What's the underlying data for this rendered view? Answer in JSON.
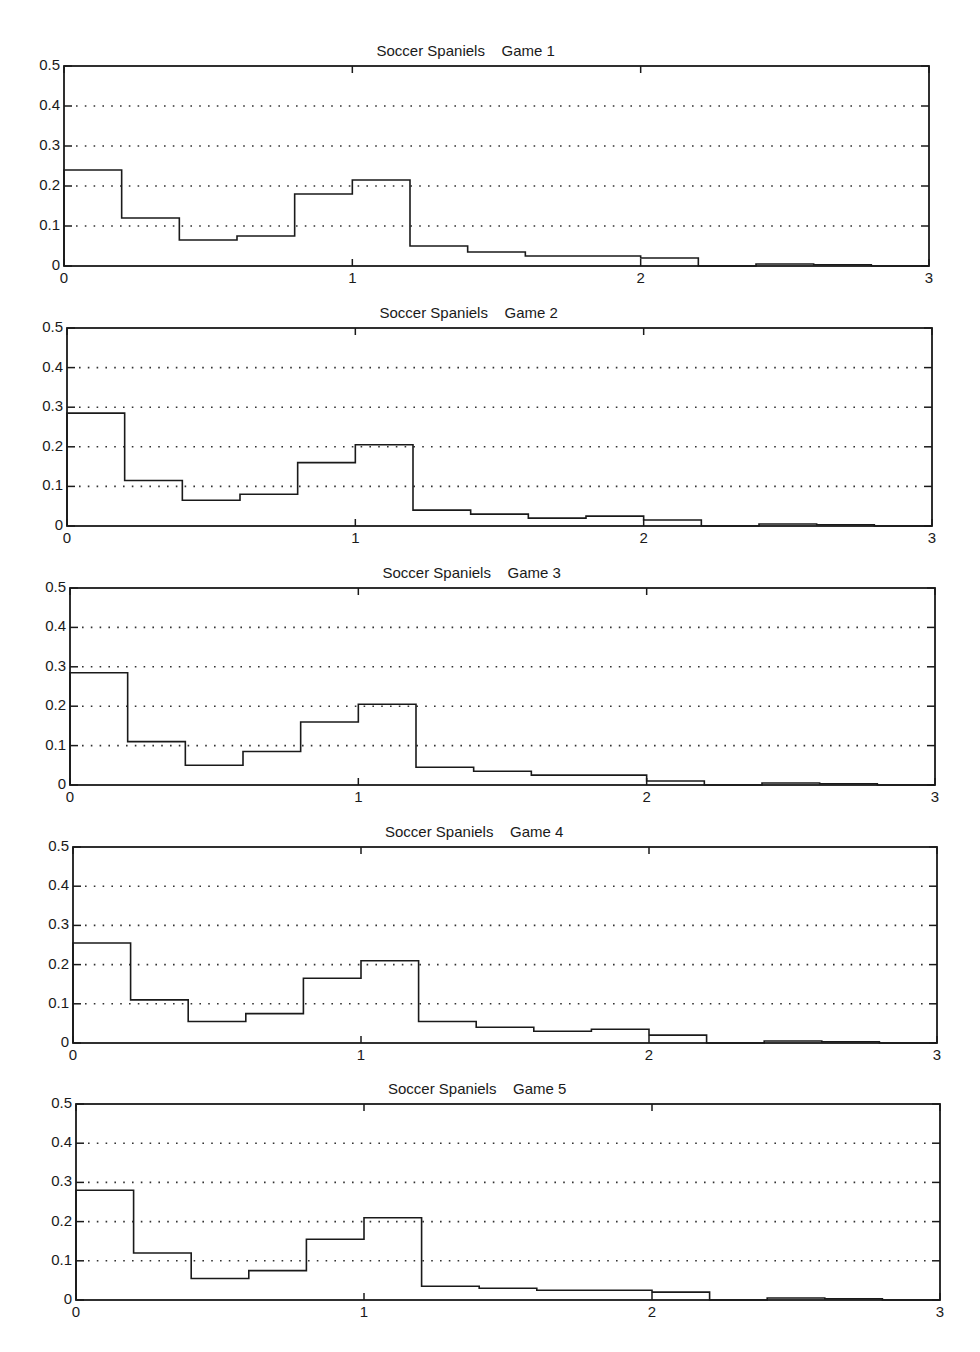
{
  "chart_data": [
    {
      "type": "histogram",
      "title": "Soccer Spaniels    Game 1",
      "xlabel": "",
      "ylabel": "",
      "xlim": [
        0,
        3
      ],
      "ylim": [
        0,
        0.5
      ],
      "x_ticks": [
        "0",
        "1",
        "2",
        "3"
      ],
      "y_ticks": [
        "0",
        "0.1",
        "0.2",
        "0.3",
        "0.4",
        "0.5"
      ],
      "grid": "horizontal-dotted",
      "bin_width": 0.2,
      "bin_edges": [
        0,
        0.2,
        0.4,
        0.6,
        0.8,
        1.0,
        1.2,
        1.4,
        1.6,
        1.8,
        2.0,
        2.2,
        2.4,
        2.6,
        2.8
      ],
      "values": [
        0.24,
        0.12,
        0.065,
        0.075,
        0.18,
        0.215,
        0.05,
        0.035,
        0.025,
        0.025,
        0.02,
        0.0,
        0.005,
        0.003,
        0.0
      ]
    },
    {
      "type": "histogram",
      "title": "Soccer Spaniels    Game 2",
      "xlabel": "",
      "ylabel": "",
      "xlim": [
        0,
        3
      ],
      "ylim": [
        0,
        0.5
      ],
      "x_ticks": [
        "0",
        "1",
        "2",
        "3"
      ],
      "y_ticks": [
        "0",
        "0.1",
        "0.2",
        "0.3",
        "0.4",
        "0.5"
      ],
      "grid": "horizontal-dotted",
      "bin_width": 0.2,
      "bin_edges": [
        0,
        0.2,
        0.4,
        0.6,
        0.8,
        1.0,
        1.2,
        1.4,
        1.6,
        1.8,
        2.0,
        2.2,
        2.4,
        2.6,
        2.8
      ],
      "values": [
        0.285,
        0.115,
        0.065,
        0.08,
        0.16,
        0.205,
        0.04,
        0.03,
        0.02,
        0.025,
        0.015,
        0.0,
        0.005,
        0.003,
        0.0
      ]
    },
    {
      "type": "histogram",
      "title": "Soccer Spaniels    Game 3",
      "xlabel": "",
      "ylabel": "",
      "xlim": [
        0,
        3
      ],
      "ylim": [
        0,
        0.5
      ],
      "x_ticks": [
        "0",
        "1",
        "2",
        "3"
      ],
      "y_ticks": [
        "0",
        "0.1",
        "0.2",
        "0.3",
        "0.4",
        "0.5"
      ],
      "grid": "horizontal-dotted",
      "bin_width": 0.2,
      "bin_edges": [
        0,
        0.2,
        0.4,
        0.6,
        0.8,
        1.0,
        1.2,
        1.4,
        1.6,
        1.8,
        2.0,
        2.2,
        2.4,
        2.6,
        2.8
      ],
      "values": [
        0.285,
        0.11,
        0.05,
        0.085,
        0.16,
        0.205,
        0.045,
        0.035,
        0.025,
        0.025,
        0.01,
        0.0,
        0.005,
        0.003,
        0.0
      ]
    },
    {
      "type": "histogram",
      "title": "Soccer Spaniels    Game 4",
      "xlabel": "",
      "ylabel": "",
      "xlim": [
        0,
        3
      ],
      "ylim": [
        0,
        0.5
      ],
      "x_ticks": [
        "0",
        "1",
        "2",
        "3"
      ],
      "y_ticks": [
        "0",
        "0.1",
        "0.2",
        "0.3",
        "0.4",
        "0.5"
      ],
      "grid": "horizontal-dotted",
      "bin_width": 0.2,
      "bin_edges": [
        0,
        0.2,
        0.4,
        0.6,
        0.8,
        1.0,
        1.2,
        1.4,
        1.6,
        1.8,
        2.0,
        2.2,
        2.4,
        2.6,
        2.8
      ],
      "values": [
        0.255,
        0.11,
        0.055,
        0.075,
        0.165,
        0.21,
        0.055,
        0.04,
        0.03,
        0.035,
        0.02,
        0.0,
        0.005,
        0.003,
        0.0
      ]
    },
    {
      "type": "histogram",
      "title": "Soccer Spaniels    Game 5",
      "xlabel": "",
      "ylabel": "",
      "xlim": [
        0,
        3
      ],
      "ylim": [
        0,
        0.5
      ],
      "x_ticks": [
        "0",
        "1",
        "2",
        "3"
      ],
      "y_ticks": [
        "0",
        "0.1",
        "0.2",
        "0.3",
        "0.4",
        "0.5"
      ],
      "grid": "horizontal-dotted",
      "bin_width": 0.2,
      "bin_edges": [
        0,
        0.2,
        0.4,
        0.6,
        0.8,
        1.0,
        1.2,
        1.4,
        1.6,
        1.8,
        2.0,
        2.2,
        2.4,
        2.6,
        2.8
      ],
      "values": [
        0.28,
        0.12,
        0.055,
        0.075,
        0.155,
        0.21,
        0.035,
        0.03,
        0.025,
        0.025,
        0.02,
        0.0,
        0.005,
        0.003,
        0.0
      ]
    }
  ],
  "layout": {
    "panels": [
      {
        "left": 64,
        "top": 66,
        "right": 929,
        "bottom": 266
      },
      {
        "left": 67,
        "top": 328,
        "right": 932,
        "bottom": 526
      },
      {
        "left": 70,
        "top": 588,
        "right": 935,
        "bottom": 785
      },
      {
        "left": 73,
        "top": 847,
        "right": 937,
        "bottom": 1043
      },
      {
        "left": 76,
        "top": 1104,
        "right": 940,
        "bottom": 1300
      }
    ]
  },
  "style": {
    "line_color": "#1a1a1a",
    "grid_color": "#333333",
    "background": "#ffffff"
  }
}
